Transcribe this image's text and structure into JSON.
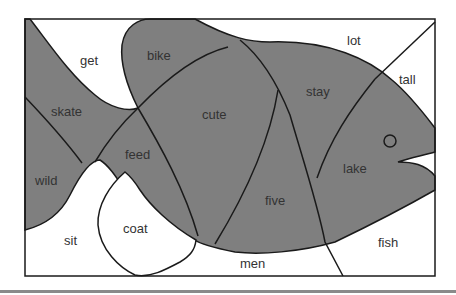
{
  "figure": {
    "type": "fish-shaped word puzzle",
    "colors": {
      "fish_fill": "#7f7f7f",
      "background": "#ffffff",
      "line": "#1a1a1a",
      "separator": "#8a8a8a"
    },
    "labels": {
      "get": "get",
      "bike": "bike",
      "lot": "lot",
      "tall": "tall",
      "skate": "skate",
      "cute": "cute",
      "stay": "stay",
      "feed": "feed",
      "lake": "lake",
      "wild": "wild",
      "five": "five",
      "coat": "coat",
      "sit": "sit",
      "fish": "fish",
      "men": "men"
    },
    "shaded_regions": [
      "bike",
      "skate",
      "cute",
      "stay",
      "feed",
      "lake",
      "wild",
      "five"
    ],
    "unshaded_regions": [
      "get",
      "lot",
      "tall",
      "coat",
      "sit",
      "fish",
      "men"
    ]
  }
}
